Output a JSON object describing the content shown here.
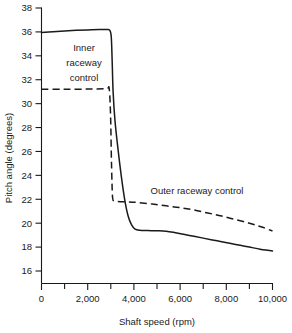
{
  "chart_data": {
    "type": "line",
    "title": "",
    "xlabel": "Shaft speed (rpm)",
    "ylabel": "Pitch angle (degrees)",
    "xlim": [
      0,
      10000
    ],
    "ylim": [
      15,
      38
    ],
    "grid": false,
    "legend_position": "inline-annotations",
    "x_ticks": [
      0,
      2000,
      4000,
      6000,
      8000,
      10000
    ],
    "x_tick_labels": [
      "0",
      "2,000",
      "4,000",
      "6,000",
      "8,000",
      "10,000"
    ],
    "x_minor_ticks": [
      1000,
      3000,
      5000,
      7000,
      9000
    ],
    "y_ticks": [
      16,
      18,
      20,
      22,
      24,
      26,
      28,
      30,
      32,
      34,
      36,
      38
    ],
    "y_tick_labels": [
      "16",
      "18",
      "20",
      "22",
      "24",
      "26",
      "28",
      "30",
      "32",
      "34",
      "36",
      "38"
    ],
    "series": [
      {
        "name": "Inner raceway control",
        "style": "solid",
        "label_lines": [
          "Inner",
          "raceway",
          "control"
        ],
        "points": [
          [
            0,
            35.95
          ],
          [
            500,
            36.02
          ],
          [
            1000,
            36.08
          ],
          [
            1500,
            36.13
          ],
          [
            2000,
            36.17
          ],
          [
            2500,
            36.2
          ],
          [
            2800,
            36.2
          ],
          [
            2950,
            36.15
          ],
          [
            3020,
            35.6
          ],
          [
            3060,
            33.5
          ],
          [
            3100,
            31.0
          ],
          [
            3180,
            28.6
          ],
          [
            3300,
            26.4
          ],
          [
            3450,
            24.0
          ],
          [
            3600,
            22.0
          ],
          [
            3750,
            20.6
          ],
          [
            3900,
            19.85
          ],
          [
            4050,
            19.5
          ],
          [
            4250,
            19.4
          ],
          [
            4600,
            19.38
          ],
          [
            5000,
            19.37
          ],
          [
            5400,
            19.33
          ],
          [
            5800,
            19.2
          ],
          [
            6200,
            19.05
          ],
          [
            6600,
            18.9
          ],
          [
            7000,
            18.75
          ],
          [
            7400,
            18.6
          ],
          [
            7800,
            18.45
          ],
          [
            8200,
            18.3
          ],
          [
            8600,
            18.15
          ],
          [
            9000,
            18.0
          ],
          [
            9400,
            17.85
          ],
          [
            9700,
            17.75
          ],
          [
            10000,
            17.68
          ]
        ]
      },
      {
        "name": "Outer raceway control",
        "style": "dashed",
        "label_lines": [
          "Outer raceway control"
        ],
        "points": [
          [
            0,
            31.2
          ],
          [
            1000,
            31.2
          ],
          [
            2000,
            31.22
          ],
          [
            2800,
            31.25
          ],
          [
            2930,
            31.25
          ],
          [
            2990,
            29.0
          ],
          [
            3020,
            26.0
          ],
          [
            3050,
            23.5
          ],
          [
            3080,
            22.1
          ],
          [
            3150,
            21.85
          ],
          [
            3400,
            21.8
          ],
          [
            3800,
            21.78
          ],
          [
            4200,
            21.72
          ],
          [
            4800,
            21.6
          ],
          [
            5400,
            21.45
          ],
          [
            6000,
            21.3
          ],
          [
            6600,
            21.1
          ],
          [
            7200,
            20.85
          ],
          [
            7800,
            20.6
          ],
          [
            8400,
            20.3
          ],
          [
            9000,
            20.0
          ],
          [
            9500,
            19.7
          ],
          [
            10000,
            19.35
          ]
        ]
      }
    ],
    "annotations": [
      {
        "name": "inner-raceway-label",
        "text_lines": [
          "Inner",
          "raceway",
          "control"
        ]
      },
      {
        "name": "outer-raceway-label",
        "text_lines": [
          "Outer raceway control"
        ]
      }
    ]
  },
  "colors": {
    "ink": "#1a1a1a",
    "background": "#ffffff"
  }
}
